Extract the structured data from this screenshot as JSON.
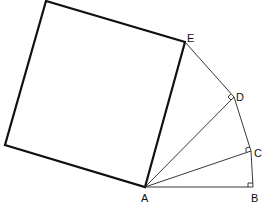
{
  "diagram": {
    "type": "geometry-wheel-of-theodorus",
    "points": {
      "A": {
        "label": "A",
        "x": 145,
        "y": 187
      },
      "B": {
        "label": "B",
        "x": 253,
        "y": 187
      },
      "C": {
        "label": "C",
        "x": 251,
        "y": 151
      },
      "D": {
        "label": "D",
        "x": 234,
        "y": 97
      },
      "E": {
        "label": "E",
        "x": 185,
        "y": 42
      }
    },
    "square": {
      "corners": [
        [
          145,
          187
        ],
        [
          185,
          42
        ],
        [
          46,
          1
        ],
        [
          5,
          145
        ]
      ]
    },
    "right_angle_marks": [
      "B",
      "C",
      "D"
    ]
  }
}
